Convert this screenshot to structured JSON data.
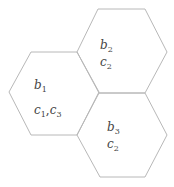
{
  "diagram": {
    "stroke_color": "#b8b8b8",
    "hexagons": [
      {
        "id": "hex1",
        "points": "9,92 31,52 77,52 99,92 77,135 31,135",
        "labels": [
          {
            "base": "b",
            "sub": "1",
            "x": 35,
            "y": 89
          },
          {
            "text": "c1,c3",
            "x": 35,
            "y": 114
          }
        ]
      },
      {
        "id": "hex2",
        "points": "77,52 98,9 145,9 167,52 145,93 99,93",
        "labels": [
          {
            "base": "b",
            "sub": "2",
            "x": 101,
            "y": 49
          },
          {
            "base": "c",
            "sub": "2",
            "x": 101,
            "y": 66
          }
        ]
      },
      {
        "id": "hex3",
        "points": "77,135 99,93 145,93 167,135 145,177 100,177",
        "labels": [
          {
            "base": "b",
            "sub": "3",
            "x": 108,
            "y": 131
          },
          {
            "base": "c",
            "sub": "2",
            "x": 108,
            "y": 148
          }
        ]
      }
    ],
    "text": {
      "hex1_b": "b",
      "hex1_b_sub": "1",
      "hex1_c1": "c",
      "hex1_c1_sub": "1",
      "hex1_sep": ",",
      "hex1_c3": "c",
      "hex1_c3_sub": "3",
      "hex2_b": "b",
      "hex2_b_sub": "2",
      "hex2_c": "c",
      "hex2_c_sub": "2",
      "hex3_b": "b",
      "hex3_b_sub": "3",
      "hex3_c": "c",
      "hex3_c_sub": "2"
    }
  }
}
